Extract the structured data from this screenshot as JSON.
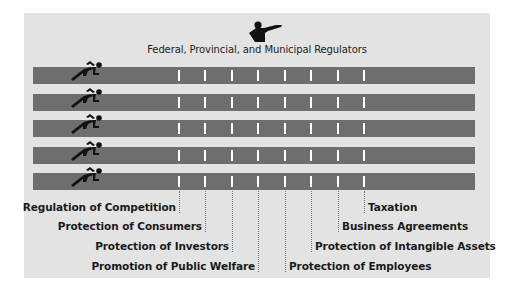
{
  "header": {
    "title": "Federal, Provincial, and Municipal Regulators",
    "icon": "pointing-official-icon"
  },
  "lanes": [
    {
      "runner_icon": "runner-icon"
    },
    {
      "runner_icon": "runner-icon"
    },
    {
      "runner_icon": "runner-icon"
    },
    {
      "runner_icon": "runner-icon"
    },
    {
      "runner_icon": "runner-icon"
    }
  ],
  "hurdles": [
    {
      "label": "Regulation of Competition",
      "side": "left"
    },
    {
      "label": "Protection of Consumers",
      "side": "left"
    },
    {
      "label": "Protection of Investors",
      "side": "left"
    },
    {
      "label": "Promotion of Public Welfare",
      "side": "left"
    },
    {
      "label": "Protection of Employees",
      "side": "right"
    },
    {
      "label": "Protection of Intangible Assets",
      "side": "right"
    },
    {
      "label": "Business Agreements",
      "side": "right"
    },
    {
      "label": "Taxation",
      "side": "right"
    }
  ],
  "colors": {
    "panel": "#e3e3e3",
    "lane": "#6e6e6e",
    "hurdle": "#ffffff",
    "text": "#1a1a1a"
  }
}
